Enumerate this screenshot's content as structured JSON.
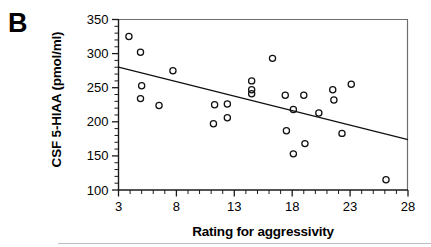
{
  "panel": {
    "letter": "B"
  },
  "chart_data": {
    "type": "scatter",
    "title": "",
    "xlabel": "Rating for aggressivity",
    "ylabel": "CSF 5-HIAA (pmol/ml)",
    "xlim": [
      3,
      28
    ],
    "ylim": [
      100,
      350
    ],
    "xticks": [
      3,
      8,
      13,
      18,
      23,
      28
    ],
    "xtick_labels": [
      "3",
      "8",
      "13",
      "18",
      "23",
      "28"
    ],
    "yticks": [
      100,
      150,
      200,
      250,
      300,
      350
    ],
    "ytick_labels": [
      "100",
      "150",
      "200",
      "250",
      "300",
      "350"
    ],
    "x_minor_tick_step": 1,
    "y_minor_tick_step": 10,
    "grid": false,
    "legend": null,
    "points": [
      {
        "x": 3.9,
        "y": 325
      },
      {
        "x": 4.9,
        "y": 302
      },
      {
        "x": 5.0,
        "y": 253
      },
      {
        "x": 4.9,
        "y": 234
      },
      {
        "x": 6.5,
        "y": 224
      },
      {
        "x": 7.7,
        "y": 275
      },
      {
        "x": 11.3,
        "y": 225
      },
      {
        "x": 11.2,
        "y": 197
      },
      {
        "x": 12.4,
        "y": 226
      },
      {
        "x": 12.4,
        "y": 206
      },
      {
        "x": 14.5,
        "y": 260
      },
      {
        "x": 14.5,
        "y": 247
      },
      {
        "x": 14.5,
        "y": 241
      },
      {
        "x": 16.3,
        "y": 293
      },
      {
        "x": 17.4,
        "y": 239
      },
      {
        "x": 17.5,
        "y": 187
      },
      {
        "x": 18.1,
        "y": 218
      },
      {
        "x": 18.1,
        "y": 153
      },
      {
        "x": 19.0,
        "y": 239
      },
      {
        "x": 19.1,
        "y": 168
      },
      {
        "x": 20.3,
        "y": 213
      },
      {
        "x": 21.5,
        "y": 247
      },
      {
        "x": 21.6,
        "y": 232
      },
      {
        "x": 22.3,
        "y": 183
      },
      {
        "x": 23.1,
        "y": 255
      },
      {
        "x": 26.1,
        "y": 115
      }
    ],
    "regression_line": {
      "x1": 3,
      "y1": 280,
      "x2": 28,
      "y2": 174
    }
  }
}
